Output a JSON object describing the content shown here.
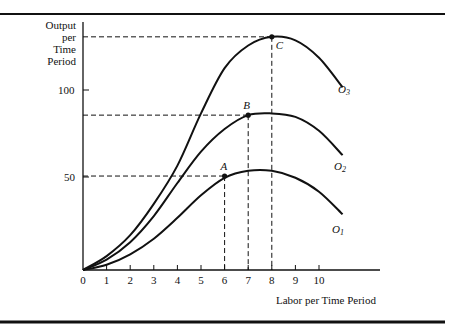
{
  "chart_data": {
    "type": "line",
    "title": "",
    "xlabel": "Labor per Time Period",
    "ylabel": "Output per Time Period",
    "ylabel_lines": [
      "Output",
      "per",
      "Time",
      "Period"
    ],
    "x_ticks": [
      "0",
      "1",
      "2",
      "3",
      "4",
      "5",
      "6",
      "7",
      "8",
      "9",
      "10"
    ],
    "y_ticks": [
      "50",
      "100"
    ],
    "xlim": [
      0,
      12.5
    ],
    "ylim": [
      0,
      140
    ],
    "grid": false,
    "series": [
      {
        "name": "O1",
        "label_main": "O",
        "label_sub": "1",
        "x": [
          0,
          1,
          2,
          3,
          4,
          5,
          6,
          7,
          8,
          9,
          10,
          11
        ],
        "values": [
          0,
          3,
          9,
          18,
          30,
          43,
          53,
          57,
          57,
          53,
          45,
          32
        ]
      },
      {
        "name": "O2",
        "label_main": "O",
        "label_sub": "2",
        "x": [
          0,
          1,
          2,
          3,
          4,
          5,
          6,
          7,
          8,
          9,
          10,
          11
        ],
        "values": [
          0,
          6,
          16,
          31,
          50,
          68,
          81,
          89,
          90,
          88,
          80,
          66
        ]
      },
      {
        "name": "O3",
        "label_main": "O",
        "label_sub": "3",
        "x": [
          0,
          1,
          2,
          3,
          4,
          5,
          6,
          7,
          8,
          9,
          10,
          11
        ],
        "values": [
          0,
          8,
          20,
          38,
          60,
          90,
          116,
          129,
          134,
          132,
          122,
          105
        ]
      }
    ],
    "annotations": [
      {
        "label": "A",
        "x": 6,
        "y": 54,
        "on": "O1"
      },
      {
        "label": "B",
        "x": 7,
        "y": 89,
        "on": "O2"
      },
      {
        "label": "C",
        "x": 8,
        "y": 134,
        "on": "O3"
      }
    ]
  }
}
